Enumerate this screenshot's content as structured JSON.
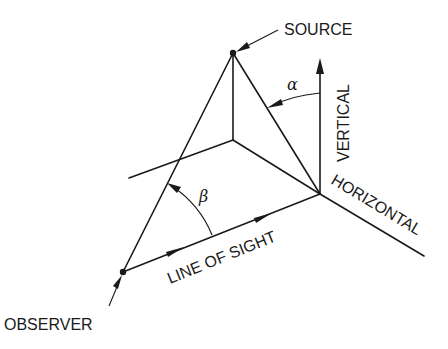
{
  "diagram": {
    "labels": {
      "source": "SOURCE",
      "observer": "OBSERVER",
      "vertical": "VERTICAL",
      "horizontal": "HORIZONTAL",
      "line_of_sight": "LINE OF SIGHT",
      "alpha": "α",
      "beta": "β"
    },
    "points": {
      "source": [
        233,
        53
      ],
      "observer": [
        123,
        272
      ],
      "junction": [
        320,
        194
      ],
      "inner_vertex": [
        233,
        140
      ],
      "left_line_end": [
        129,
        178
      ],
      "horizontal_end": [
        424,
        256
      ],
      "vertical_top": [
        320,
        60
      ]
    },
    "colors": {
      "stroke": "#1a1a1a",
      "background": "#ffffff"
    }
  }
}
